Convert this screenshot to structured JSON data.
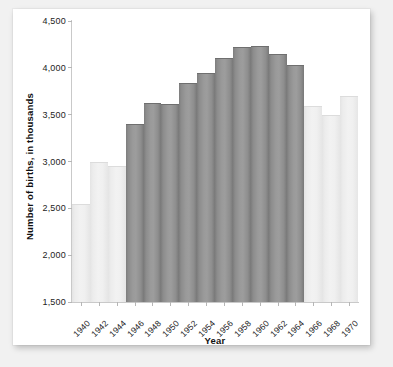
{
  "chart_data": {
    "type": "bar",
    "title": "",
    "xlabel": "Year",
    "ylabel": "Number of births, in thousands",
    "ylim": [
      1500,
      4500
    ],
    "ytick_labels": [
      "1,500",
      "2,000",
      "2,500",
      "3,000",
      "3,500",
      "4,000",
      "4,500"
    ],
    "ytick_values": [
      1500,
      2000,
      2500,
      3000,
      3500,
      4000,
      4500
    ],
    "grid": false,
    "legend": null,
    "categories": [
      "1940",
      "1942",
      "1944",
      "1946",
      "1948",
      "1950",
      "1952",
      "1954",
      "1956",
      "1958",
      "1960",
      "1962",
      "1964",
      "1966",
      "1968",
      "1970"
    ],
    "values": [
      2550,
      2990,
      2950,
      3400,
      3620,
      3610,
      3840,
      3940,
      4100,
      4220,
      4230,
      4150,
      4030,
      3590,
      3500,
      3700
    ],
    "highlight": [
      false,
      false,
      false,
      true,
      true,
      true,
      true,
      true,
      true,
      true,
      true,
      true,
      true,
      false,
      false,
      false
    ],
    "colors": {
      "bar_highlight": "#9a9a9a",
      "bar_muted": "#ededed",
      "axis": "#c9c9c9",
      "text": "#1d1d1d",
      "card_background": "#ffffff",
      "page_background": "#f1f1f1"
    }
  }
}
